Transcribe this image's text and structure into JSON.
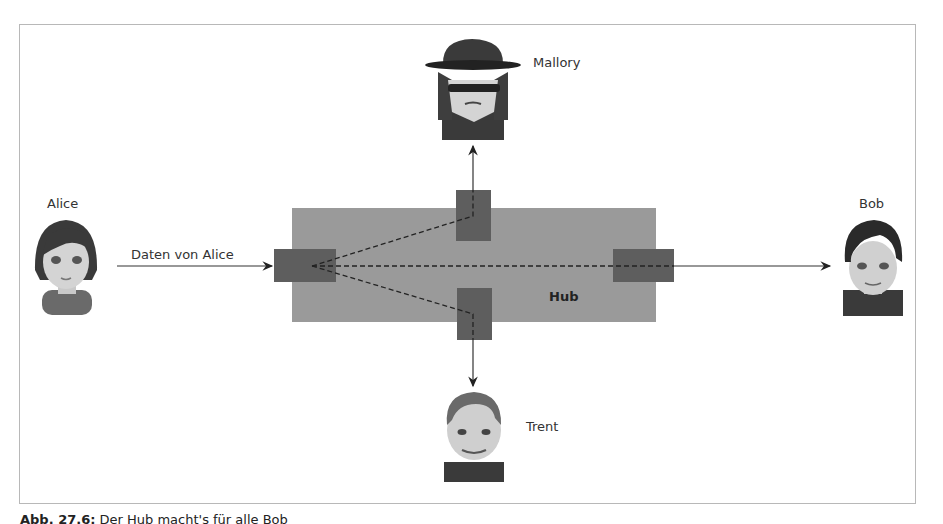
{
  "diagram": {
    "actors": {
      "alice": {
        "label": "Alice"
      },
      "bob": {
        "label": "Bob"
      },
      "mallory": {
        "label": "Mallory"
      },
      "trent": {
        "label": "Trent"
      }
    },
    "arrow_label": "Daten von Alice",
    "hub_label": "Hub",
    "colors": {
      "hub_body": "#9a9a9a",
      "port": "#5e5e5e",
      "line": "#333333",
      "frame_border": "#b8b8b8"
    }
  },
  "caption": {
    "prefix": "Abb. 27.6:",
    "text": "Der Hub macht's für alle Bob"
  }
}
